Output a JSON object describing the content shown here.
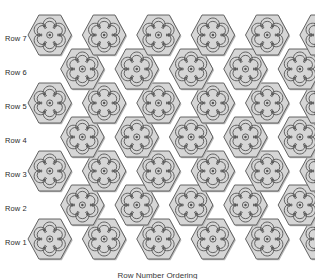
{
  "figure": {
    "caption": "Row Number Ordering",
    "width": 315,
    "height": 279,
    "background_color": "#ffffff"
  },
  "tiling": {
    "tile_shape": "hexagon",
    "tile_orientation": "flat-top",
    "motif": "six-petal-flower",
    "fill_color": "#d6d6d6",
    "stroke_color": "#555555",
    "shadow_color": "#b8b8b8",
    "hex_width": 43.5,
    "hex_height": 40.0,
    "row_step": 34.0,
    "origin_x": 28.0,
    "origin_y": 239.0,
    "rows": [
      {
        "label": "Row 1",
        "index": 1,
        "count": 7,
        "offset": 0
      },
      {
        "label": "Row 2",
        "index": 2,
        "count": 6,
        "offset": 1
      },
      {
        "label": "Row 3",
        "index": 3,
        "count": 7,
        "offset": 0
      },
      {
        "label": "Row 4",
        "index": 4,
        "count": 6,
        "offset": 1
      },
      {
        "label": "Row 5",
        "index": 5,
        "count": 7,
        "offset": 0
      },
      {
        "label": "Row 6",
        "index": 6,
        "count": 6,
        "offset": 1
      },
      {
        "label": "Row 7",
        "index": 7,
        "count": 7,
        "offset": 0
      }
    ]
  },
  "labels": {
    "row_1": "Row 1",
    "row_2": "Row 2",
    "row_3": "Row 3",
    "row_4": "Row 4",
    "row_5": "Row 5",
    "row_6": "Row 6",
    "row_7": "Row 7"
  },
  "chart_data": {
    "type": "table",
    "xlabel": "",
    "ylabel": "",
    "categories": [
      "Row 1",
      "Row 2",
      "Row 3",
      "Row 4",
      "Row 5",
      "Row 6",
      "Row 7"
    ],
    "values": [
      7,
      6,
      7,
      6,
      7,
      6,
      7
    ],
    "series": [
      {
        "name": "tiles per row",
        "values": [
          7,
          6,
          7,
          6,
          7,
          6,
          7
        ]
      }
    ],
    "annotations": [
      "Odd rows contain 7 hexagonal tiles and are flush left.",
      "Even rows contain 6 hexagonal tiles and are offset right by half a tile.",
      "Every tile carries an identical six-petal flower motif with a ringed center."
    ],
    "legend_position": "none",
    "grid": false
  }
}
